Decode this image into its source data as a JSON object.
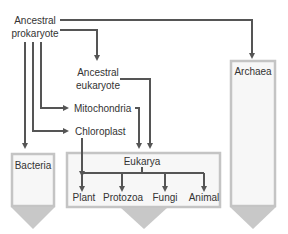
{
  "diagram": {
    "nodes": {
      "ancestral_prokaryote": {
        "line1": "Ancestral",
        "line2": "prokaryote"
      },
      "ancestral_eukaryote": {
        "line1": "Ancestral",
        "line2": "eukaryote"
      },
      "mitochondria": {
        "label": "Mitochondria"
      },
      "chloroplast": {
        "label": "Chloroplast"
      },
      "bacteria": {
        "label": "Bacteria"
      },
      "eukarya": {
        "label": "Eukarya"
      },
      "archaea": {
        "label": "Archaea"
      },
      "plant": {
        "label": "Plant"
      },
      "protozoa": {
        "label": "Protozoa"
      },
      "fungi": {
        "label": "Fungi"
      },
      "animal": {
        "label": "Animal"
      }
    },
    "edges": [
      {
        "from": "Ancestral prokaryote",
        "to": "Archaea"
      },
      {
        "from": "Ancestral prokaryote",
        "to": "Ancestral eukaryote"
      },
      {
        "from": "Ancestral prokaryote",
        "to": "Mitochondria"
      },
      {
        "from": "Ancestral prokaryote",
        "to": "Chloroplast"
      },
      {
        "from": "Ancestral prokaryote",
        "to": "Bacteria"
      },
      {
        "from": "Ancestral eukaryote",
        "to": "Eukarya"
      },
      {
        "from": "Mitochondria",
        "to": "Eukarya"
      },
      {
        "from": "Chloroplast",
        "to": "Plant"
      },
      {
        "from": "Eukarya",
        "to": "Plant"
      },
      {
        "from": "Eukarya",
        "to": "Protozoa"
      },
      {
        "from": "Eukarya",
        "to": "Fungi"
      },
      {
        "from": "Eukarya",
        "to": "Animal"
      }
    ],
    "colors": {
      "arrow": "#555555",
      "box_border": "#c4c4c4",
      "box_fill": "#f7f7f7",
      "big_arrow": "#c8c8c8",
      "text": "#333333"
    }
  }
}
